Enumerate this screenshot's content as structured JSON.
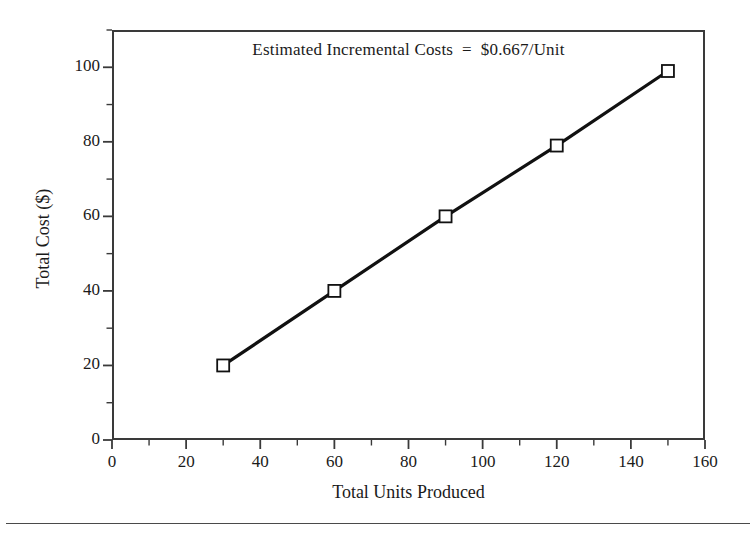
{
  "figure": {
    "annotation": "Estimated Incremental Costs  =  $0.667/Unit",
    "line_color": "#111111",
    "marker_fill": "#ffffff",
    "marker_edge": "#111111",
    "axis_color": "#3a3a3a",
    "background": "#ffffff"
  },
  "chart_data": {
    "type": "line",
    "title": "",
    "annotation": "Estimated Incremental Costs  =  $0.667/Unit",
    "xlabel": "Total Units Produced",
    "ylabel": "Total Cost ($)",
    "xlim": [
      0,
      160
    ],
    "ylim": [
      0,
      110
    ],
    "grid": false,
    "legend": "none",
    "x_major_ticks": [
      0,
      20,
      40,
      60,
      80,
      100,
      120,
      140,
      160
    ],
    "x_minor_ticks": [
      10,
      30,
      50,
      70,
      90,
      110,
      130,
      150
    ],
    "x_tick_labels": [
      "0",
      "20",
      "40",
      "60",
      "80",
      "100",
      "120",
      "140",
      "160"
    ],
    "y_major_ticks": [
      0,
      20,
      40,
      60,
      80,
      100
    ],
    "y_minor_ticks": [
      10,
      30,
      50,
      70,
      90,
      110
    ],
    "y_tick_labels": [
      "0",
      "20",
      "40",
      "60",
      "80",
      "100"
    ],
    "marker": "open-square",
    "series": [
      {
        "name": "Total Cost",
        "x": [
          30,
          60,
          90,
          120,
          150
        ],
        "values": [
          20,
          40,
          60,
          79,
          99
        ]
      }
    ],
    "slope": 0.667,
    "slope_units": "$/Unit"
  }
}
